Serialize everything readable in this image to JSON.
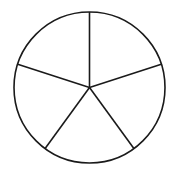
{
  "diagram": {
    "type": "circle-divided-into-equal-sectors",
    "sectors": 5,
    "center": [
      89.5,
      87.5
    ],
    "radius": 75.5,
    "spoke_angles_deg": [
      90,
      18,
      -54,
      -126,
      162
    ],
    "stroke_color": "#1a1a1a",
    "fill_color": "#ffffff",
    "stroke_width": 1.6
  }
}
